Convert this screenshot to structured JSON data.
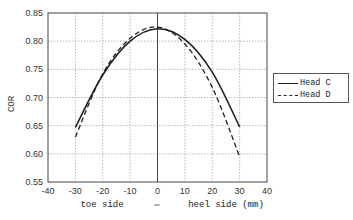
{
  "chart_data": {
    "type": "line",
    "title": "",
    "xlabel": "toe side  ⇔  heel side (mm)",
    "xlabel_parts": {
      "left": "toe side",
      "center": "⇔",
      "right": "heel side (mm)"
    },
    "ylabel": "COR",
    "xlim": [
      -40,
      40
    ],
    "ylim": [
      0.55,
      0.85
    ],
    "x_ticks": [
      -40,
      -30,
      -20,
      -10,
      0,
      10,
      20,
      30,
      40
    ],
    "y_ticks": [
      0.55,
      0.6,
      0.65,
      0.7,
      0.75,
      0.8,
      0.85
    ],
    "x_tick_labels": [
      "-40",
      "-30",
      "-20",
      "-10",
      "0",
      "10",
      "20",
      "30",
      "40"
    ],
    "y_tick_labels": [
      "0.55",
      "0.60",
      "0.65",
      "0.70",
      "0.75",
      "0.80",
      "0.85"
    ],
    "grid": true,
    "legend_position": "right",
    "x": [
      -30,
      -20,
      -10,
      0,
      10,
      20,
      30
    ],
    "series": [
      {
        "name": "Head C",
        "style": "solid",
        "values": [
          0.647,
          0.74,
          0.8,
          0.822,
          0.803,
          0.745,
          0.648
        ]
      },
      {
        "name": "Head D",
        "style": "dashed",
        "values": [
          0.63,
          0.742,
          0.805,
          0.825,
          0.795,
          0.718,
          0.595
        ]
      }
    ]
  },
  "legend": {
    "items": [
      {
        "label": "Head C",
        "style": "solid"
      },
      {
        "label": "Head D",
        "style": "dashed"
      }
    ]
  },
  "colors": {
    "line": "#222222",
    "grid": "#999999",
    "axis": "#444444"
  }
}
